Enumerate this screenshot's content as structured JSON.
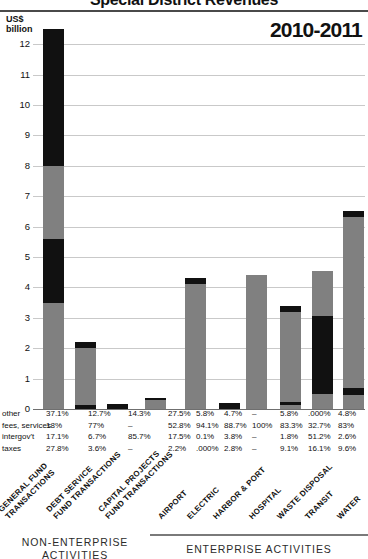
{
  "header": {
    "title": "Special District Revenues",
    "year_label": "2010-2011",
    "unit_line1": "US$",
    "unit_line2": "billion"
  },
  "axis": {
    "yticks": [
      "12",
      "11",
      "10",
      "9",
      "8",
      "7",
      "6",
      "5",
      "4",
      "3",
      "2",
      "1",
      "0"
    ],
    "ymin": 0,
    "ymax": 12.5
  },
  "table": {
    "row_labels": [
      "other",
      "fees, services",
      "intergov't",
      "taxes"
    ],
    "rows": [
      [
        "37.1%",
        "12.7%",
        "14.3%",
        "27.5%",
        "5.8%",
        "4.7%",
        "–",
        "5.8%",
        ".000%",
        "4.8%"
      ],
      [
        "18%",
        "77%",
        "–",
        "52.8%",
        "94.1%",
        "88.7%",
        "100%",
        "83.3%",
        "32.7%",
        "83%"
      ],
      [
        "17.1%",
        "6.7%",
        "85.7%",
        "17.5%",
        "0.1%",
        "3.8%",
        "–",
        "1.8%",
        "51.2%",
        "2.6%"
      ],
      [
        "27.8%",
        "3.6%",
        "–",
        "2.2%",
        ".000%",
        "2.8%",
        "–",
        "9.1%",
        "16.1%",
        "9.6%"
      ]
    ]
  },
  "categories": [
    "GENERAL FUND\nTRANSACTIONS",
    "DEBT SERVICE\nFUND TRANSACTIONS",
    "CAPITAL PROJECTS\nFUND TRANSACTIONS",
    "AIRPORT",
    "ELECTRIC",
    "HARBOR & PORT",
    "HOSPITAL",
    "WASTE DISPOSAL",
    "TRANSIT",
    "WATER"
  ],
  "groups": {
    "left_label": "NON-ENTERPRISE\nACTIVITIES",
    "right_label": "ENTERPRISE ACTIVITIES"
  },
  "colors": {
    "dark": "#111111",
    "gray": "#808080",
    "grid": "#c9c9c9",
    "rule": "#4a4a4a"
  },
  "chart_data": {
    "type": "bar",
    "title": "Special District Revenues",
    "subtitle": "2010-2011",
    "xlabel": "",
    "ylabel": "US$ billion",
    "ylim": [
      0,
      12.5
    ],
    "grid": true,
    "legend_position": "none",
    "stacked": true,
    "categories": [
      "GENERAL FUND TRANSACTIONS",
      "DEBT SERVICE FUND TRANSACTIONS",
      "CAPITAL PROJECTS FUND TRANSACTIONS",
      "AIRPORT",
      "ELECTRIC",
      "HARBOR & PORT",
      "HOSPITAL",
      "WASTE DISPOSAL",
      "TRANSIT",
      "WATER"
    ],
    "totals": [
      12.5,
      2.2,
      0.18,
      0.36,
      4.3,
      0.2,
      4.4,
      3.4,
      4.55,
      6.5
    ],
    "stacks": [
      [
        {
          "color": "gray",
          "from": 0.0,
          "to": 3.5
        },
        {
          "color": "dark",
          "from": 3.5,
          "to": 5.6
        },
        {
          "color": "gray",
          "from": 5.6,
          "to": 8.0
        },
        {
          "color": "dark",
          "from": 8.0,
          "to": 12.5
        }
      ],
      [
        {
          "color": "dark",
          "from": 0.0,
          "to": 0.13
        },
        {
          "color": "gray",
          "from": 0.13,
          "to": 2.0
        },
        {
          "color": "dark",
          "from": 2.0,
          "to": 2.2
        }
      ],
      [
        {
          "color": "dark",
          "from": 0.0,
          "to": 0.18
        }
      ],
      [
        {
          "color": "gray",
          "from": 0.0,
          "to": 0.28
        },
        {
          "color": "dark",
          "from": 0.28,
          "to": 0.36
        }
      ],
      [
        {
          "color": "gray",
          "from": 0.0,
          "to": 4.1
        },
        {
          "color": "dark",
          "from": 4.1,
          "to": 4.3
        }
      ],
      [
        {
          "color": "dark",
          "from": 0.0,
          "to": 0.2
        }
      ],
      [
        {
          "color": "gray",
          "from": 0.0,
          "to": 4.4
        }
      ],
      [
        {
          "color": "gray",
          "from": 0.0,
          "to": 0.13
        },
        {
          "color": "dark",
          "from": 0.13,
          "to": 0.23
        },
        {
          "color": "gray",
          "from": 0.23,
          "to": 3.2
        },
        {
          "color": "dark",
          "from": 3.2,
          "to": 3.4
        }
      ],
      [
        {
          "color": "gray",
          "from": 0.0,
          "to": 0.5
        },
        {
          "color": "dark",
          "from": 0.5,
          "to": 3.05
        },
        {
          "color": "gray",
          "from": 3.05,
          "to": 4.55
        }
      ],
      [
        {
          "color": "gray",
          "from": 0.0,
          "to": 0.45
        },
        {
          "color": "dark",
          "from": 0.45,
          "to": 0.68
        },
        {
          "color": "gray",
          "from": 0.68,
          "to": 6.3
        },
        {
          "color": "dark",
          "from": 6.3,
          "to": 6.5
        }
      ]
    ],
    "series": [
      {
        "name": "other",
        "values": [
          "37.1%",
          "12.7%",
          "14.3%",
          "27.5%",
          "5.8%",
          "4.7%",
          "–",
          "5.8%",
          ".000%",
          "4.8%"
        ]
      },
      {
        "name": "fees, services",
        "values": [
          "18%",
          "77%",
          "–",
          "52.8%",
          "94.1%",
          "88.7%",
          "100%",
          "83.3%",
          "32.7%",
          "83%"
        ]
      },
      {
        "name": "intergov't",
        "values": [
          "17.1%",
          "6.7%",
          "85.7%",
          "17.5%",
          "0.1%",
          "3.8%",
          "–",
          "1.8%",
          "51.2%",
          "2.6%"
        ]
      },
      {
        "name": "taxes",
        "values": [
          "27.8%",
          "3.6%",
          "–",
          "2.2%",
          ".000%",
          "2.8%",
          "–",
          "9.1%",
          "16.1%",
          "9.6%"
        ]
      }
    ]
  }
}
